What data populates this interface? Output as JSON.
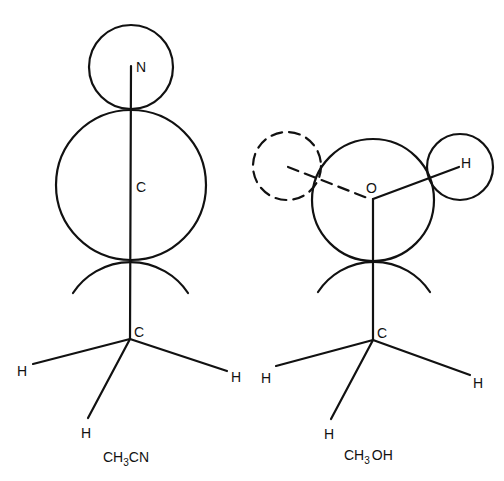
{
  "diagram": {
    "molecules": [
      {
        "name": "CH3CN",
        "formula": {
          "prefix": "CH",
          "subscript": "3",
          "suffix": "CN"
        },
        "atoms": {
          "N": {
            "label": "N",
            "sphere": {
              "cx": 131,
              "cy": 67,
              "r": 42
            }
          },
          "C_nitrile": {
            "label": "C",
            "sphere": {
              "cx": 131,
              "cy": 185,
              "r": 74
            }
          },
          "C_methyl": {
            "label": "C",
            "x": 130,
            "y": 339,
            "arc": {
              "cx": 130,
              "cy": 331,
              "r": 69
            }
          },
          "H": [
            {
              "label": "H",
              "x": 22,
              "y": 371
            },
            {
              "label": "H",
              "x": 236,
              "y": 381
            },
            {
              "label": "H",
              "x": 86,
              "y": 436
            }
          ]
        }
      },
      {
        "name": "CH3OH",
        "formula": {
          "prefix": "CH",
          "subscript": "3",
          "suffix": "OH"
        },
        "atoms": {
          "O": {
            "label": "O",
            "sphere": {
              "cx": 373,
              "cy": 200,
              "r": 61
            }
          },
          "H_hydroxyl": {
            "label": "H",
            "sphere": {
              "cx": 460,
              "cy": 167,
              "r": 33
            }
          },
          "H_hidden": {
            "style": "dashed",
            "sphere": {
              "cx": 287,
              "cy": 166,
              "r": 34
            }
          },
          "C_methyl": {
            "label": "C",
            "x": 373,
            "y": 340,
            "arc": {
              "cx": 373,
              "cy": 329,
              "r": 67
            }
          },
          "H": [
            {
              "label": "H",
              "x": 267,
              "y": 382
            },
            {
              "label": "H",
              "x": 478,
              "y": 387
            },
            {
              "label": "H",
              "x": 329,
              "y": 438
            }
          ]
        }
      }
    ],
    "labels": {
      "left_N": "N",
      "left_C_top": "C",
      "left_C_bottom": "C",
      "left_H1": "H",
      "left_H2": "H",
      "left_H3": "H",
      "left_formula_prefix": "CH",
      "left_formula_sub": "3",
      "left_formula_suffix": "CN",
      "right_O": "O",
      "right_H_top": "H",
      "right_C_bottom": "C",
      "right_H1": "H",
      "right_H2": "H",
      "right_H3": "H",
      "right_formula_prefix": "CH",
      "right_formula_sub": "3",
      "right_formula_suffix": "OH"
    }
  }
}
